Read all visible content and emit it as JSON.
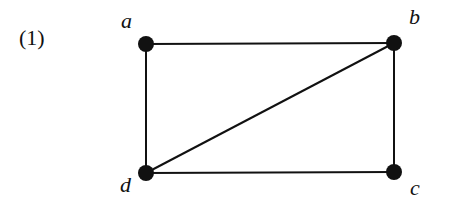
{
  "figure": {
    "number_label": "(1)",
    "nodes": [
      {
        "id": "a",
        "label": "a",
        "x": 146,
        "y": 44
      },
      {
        "id": "b",
        "label": "b",
        "x": 394,
        "y": 43
      },
      {
        "id": "c",
        "label": "c",
        "x": 394,
        "y": 172
      },
      {
        "id": "d",
        "label": "d",
        "x": 146,
        "y": 173
      }
    ],
    "edges": [
      {
        "from": "a",
        "to": "b"
      },
      {
        "from": "b",
        "to": "c"
      },
      {
        "from": "c",
        "to": "d"
      },
      {
        "from": "d",
        "to": "a"
      },
      {
        "from": "d",
        "to": "b"
      }
    ],
    "colors": {
      "node": "#111111",
      "edge": "#111111",
      "background": "#ffffff"
    }
  }
}
